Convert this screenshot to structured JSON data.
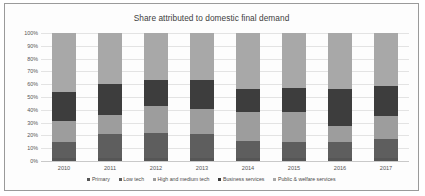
{
  "chart_data": {
    "type": "bar",
    "stacked": true,
    "title": "Share attributed to domestic final demand",
    "xlabel": "",
    "ylabel": "",
    "ylim": [
      0,
      100
    ],
    "grid": true,
    "legend_position": "bottom",
    "categories": [
      "2010",
      "2011",
      "2012",
      "2013",
      "2014",
      "2015",
      "2016",
      "2017"
    ],
    "ytick_labels": [
      "0%",
      "10%",
      "20%",
      "30%",
      "40%",
      "50%",
      "60%",
      "70%",
      "80%",
      "90%",
      "100%"
    ],
    "ytick_values": [
      0,
      10,
      20,
      30,
      40,
      50,
      60,
      70,
      80,
      90,
      100
    ],
    "series": [
      {
        "name": "Primary",
        "color": "#565656",
        "values": [
          2,
          2,
          2,
          2,
          2,
          2,
          2,
          2
        ]
      },
      {
        "name": "Low tech",
        "color": "#5e5e5e",
        "values": [
          13,
          19,
          20,
          19,
          14,
          13,
          13,
          15
        ]
      },
      {
        "name": "High and medium tech",
        "color": "#9d9d9d",
        "values": [
          16,
          15,
          21,
          20,
          22,
          23,
          12,
          18
        ]
      },
      {
        "name": "Business services",
        "color": "#3d3d3d",
        "values": [
          23,
          24,
          20,
          22,
          18,
          19,
          29,
          24
        ]
      },
      {
        "name": "Public & welfare services",
        "color": "#a8a8a8",
        "values": [
          46,
          40,
          37,
          37,
          44,
          43,
          44,
          41
        ]
      }
    ]
  }
}
